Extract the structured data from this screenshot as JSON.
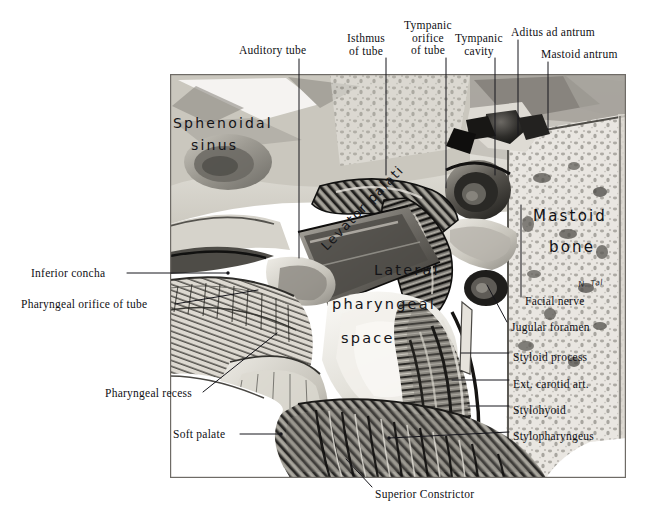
{
  "figure": {
    "title_present": false,
    "signature": "N. Tal",
    "plate": {
      "x": 170,
      "y": 74,
      "width": 456,
      "height": 404
    }
  },
  "colors": {
    "ink": "#0f0f14",
    "plate_light": "#efeee9",
    "plate_mid": "#b9b6ae",
    "plate_dark": "#4a4844",
    "plate_black": "#1d1c1a",
    "leader": "#16161c"
  },
  "printed_labels": [
    {
      "id": "auditory-tube",
      "text": "Auditory tube",
      "x": 239,
      "y": 44,
      "align": "left"
    },
    {
      "id": "isthmus-of-tube",
      "text": "Isthmus\nof tube",
      "x": 366,
      "y": 32,
      "align": "center"
    },
    {
      "id": "tympanic-orifice-of-tube",
      "text": "Tympanic\norifice\nof tube",
      "x": 428,
      "y": 19,
      "align": "center"
    },
    {
      "id": "tympanic-cavity",
      "text": "Tympanic\ncavity",
      "x": 478,
      "y": 32,
      "align": "center"
    },
    {
      "id": "aditus-ad-antrum",
      "text": "Aditus ad antrum",
      "x": 511,
      "y": 26,
      "align": "left"
    },
    {
      "id": "mastoid-antrum",
      "text": "Mastoid antrum",
      "x": 541,
      "y": 48,
      "align": "left"
    },
    {
      "id": "inferior-concha",
      "text": "Inferior concha",
      "x": 31,
      "y": 269,
      "align": "left"
    },
    {
      "id": "pharyngeal-orifice-of-tube",
      "text": "Pharyngeal orifice of tube",
      "x": 21,
      "y": 300,
      "align": "left"
    },
    {
      "id": "pharyngeal-recess",
      "text": "Pharyngeal recess",
      "x": 105,
      "y": 389,
      "align": "left"
    },
    {
      "id": "soft-palate",
      "text": "Soft palate",
      "x": 173,
      "y": 430,
      "align": "left"
    },
    {
      "id": "facial-nerve",
      "text": "Facial nerve",
      "x": 525,
      "y": 301,
      "align": "left"
    },
    {
      "id": "jugular-foramen",
      "text": "Jugular foramen",
      "x": 511,
      "y": 327,
      "align": "left"
    },
    {
      "id": "styloid-process",
      "text": "Styloid process",
      "x": 513,
      "y": 357,
      "align": "left"
    },
    {
      "id": "ext-carotid-art",
      "text": "Ext. carotid art.",
      "x": 513,
      "y": 384,
      "align": "left"
    },
    {
      "id": "stylohyoid",
      "text": "Stylohyoid",
      "x": 513,
      "y": 410,
      "align": "left"
    },
    {
      "id": "stylopharyngeus",
      "text": "Stylopharyngeus",
      "x": 513,
      "y": 436,
      "align": "left"
    },
    {
      "id": "superior-constrictor",
      "text": "Superior Constrictor",
      "x": 375,
      "y": 490,
      "align": "left"
    }
  ],
  "handwritten_labels": [
    {
      "id": "sphenoidal-sinus-line1",
      "text": "Sphenoidal"
    },
    {
      "id": "sphenoidal-sinus-line2",
      "text": "sinus"
    },
    {
      "id": "lateral-pharyngeal-space-line1",
      "text": "Lateral"
    },
    {
      "id": "lateral-pharyngeal-space-line2",
      "text": "pharyngeal"
    },
    {
      "id": "lateral-pharyngeal-space-line3",
      "text": "space"
    },
    {
      "id": "mastoid-bone-line1",
      "text": "Mastoid"
    },
    {
      "id": "mastoid-bone-line2",
      "text": "bone"
    },
    {
      "id": "levator-palati",
      "text": "Levator palati"
    }
  ],
  "leader_lines": [
    {
      "id": "leader-auditory-tube",
      "points": "299,59 299,258"
    },
    {
      "id": "leader-isthmus-of-tube",
      "points": "386,58 386,175"
    },
    {
      "id": "leader-tympanic-orifice-of-tube",
      "points": "446,58 446,188"
    },
    {
      "id": "leader-tympanic-cavity",
      "points": "495,58 495,175"
    },
    {
      "id": "leader-aditus-ad-antrum",
      "points": "518,40 518,135"
    },
    {
      "id": "leader-mastoid-antrum",
      "points": "548,62 548,130"
    },
    {
      "id": "leader-inferior-concha",
      "points": "127,273 228,273"
    },
    {
      "id": "leader-pharyngeal-orifice",
      "points": "175,304 258,290"
    },
    {
      "id": "leader-pharyngeal-recess",
      "points": "203,392 277,333"
    },
    {
      "id": "leader-soft-palate",
      "points": "240,434 281,434"
    },
    {
      "id": "leader-facial-nerve",
      "points": "521,297 521,205"
    },
    {
      "id": "leader-jugular-foramen",
      "points": "507,322 487,285"
    },
    {
      "id": "leader-styloid-process",
      "points": "509,353 461,353"
    },
    {
      "id": "leader-ext-carotid-art",
      "points": "509,380 452,380"
    },
    {
      "id": "leader-stylohyoid",
      "points": "509,406 468,406"
    },
    {
      "id": "leader-stylopharyngeus",
      "points": "509,432 389,438"
    },
    {
      "id": "leader-superior-constrictor",
      "points": "372,487 346,459"
    }
  ]
}
